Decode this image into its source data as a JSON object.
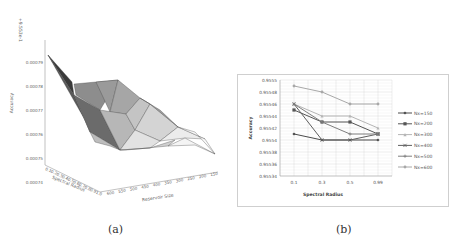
{
  "chart_data": [
    {
      "id": "a",
      "type": "surface3d",
      "caption": "(a)",
      "offset_label": "+9.553e-1",
      "zlabel": "Accuracy",
      "xlabel": "Reservoir Size",
      "ylabel": "Spectral Radius",
      "z_ticks": [
        "0.00079",
        "0.00078",
        "0.00077",
        "0.00076",
        "0.00075",
        "0.00074"
      ],
      "x_ticks": [
        "600",
        "550",
        "500",
        "450",
        "400",
        "350",
        "300",
        "250",
        "200",
        "150"
      ],
      "y_ticks": [
        "0.1",
        "0.2",
        "0.3",
        "0.4",
        "0.5",
        "0.6",
        "0.7",
        "0.8",
        "0.9",
        "1.0"
      ],
      "grid": false
    },
    {
      "id": "b",
      "type": "line",
      "caption": "(b)",
      "title": "",
      "xlabel": "Spectral Radius",
      "ylabel": "Accuracy",
      "categories": [
        "0.1",
        "0.3",
        "0.5",
        "0.99"
      ],
      "y_ticks": [
        "0.9555",
        "0.95548",
        "0.95546",
        "0.95544",
        "0.95542",
        "0.9554",
        "0.95538",
        "0.95536",
        "0.95534"
      ],
      "ylim": [
        0.95534,
        0.9555
      ],
      "grid": true,
      "legend_position": "right",
      "series": [
        {
          "name": "Nx=150",
          "marker": "diamond",
          "color": "#4a4a4a",
          "values": [
            0.95541,
            0.9554,
            0.9554,
            0.9554
          ]
        },
        {
          "name": "Nx=200",
          "marker": "square",
          "color": "#555555",
          "values": [
            0.95545,
            0.95543,
            0.95543,
            0.95541
          ]
        },
        {
          "name": "Nx=300",
          "marker": "triangle",
          "color": "#b5b5b5",
          "values": [
            0.95546,
            0.95544,
            0.95544,
            0.95542
          ]
        },
        {
          "name": "Nx=400",
          "marker": "x",
          "color": "#5e5e5e",
          "values": [
            0.95546,
            0.9554,
            0.9554,
            0.95541
          ]
        },
        {
          "name": "Nx=500",
          "marker": "star",
          "color": "#7e7e7e",
          "values": [
            0.95546,
            0.95543,
            0.95541,
            0.95541
          ]
        },
        {
          "name": "Nx=600",
          "marker": "circle",
          "color": "#a8a8a8",
          "values": [
            0.95549,
            0.95548,
            0.95546,
            0.95546
          ]
        }
      ]
    }
  ]
}
